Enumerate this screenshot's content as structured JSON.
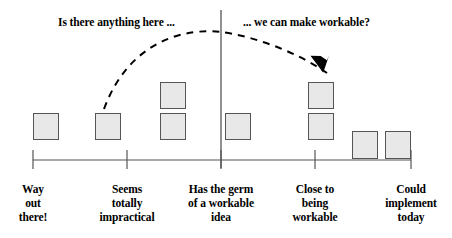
{
  "figure": {
    "colors": {
      "box_fill": "#e8e8e8",
      "box_stroke": "#555555",
      "axis_stroke": "#555555",
      "text": "#000000",
      "arc_stroke": "#000000",
      "background": "#ffffff"
    }
  },
  "annotations": {
    "left_callout": "Is there anything here ...",
    "right_callout": "... we can make workable?",
    "arrow": {
      "name": "dashed-curved-arrow",
      "start_x": 104,
      "start_y": 109,
      "peak_x": 221,
      "peak_y": 32,
      "end_x": 327,
      "end_y": 73,
      "style": "dashed",
      "arrowhead": "filled-triangle"
    }
  },
  "axis": {
    "name": "feasibility-axis",
    "line_y": 160,
    "start_x": 33,
    "end_x": 411,
    "divider_x": 221,
    "divider_top_y": 10,
    "divider_bottom_y": 168,
    "ticks": [
      {
        "x": 33,
        "lines": [
          "Way",
          "out",
          "there!"
        ]
      },
      {
        "x": 127,
        "lines": [
          "Seems",
          "totally",
          "impractical"
        ]
      },
      {
        "x": 221,
        "lines": [
          "Has the germ",
          "of a workable",
          "idea"
        ]
      },
      {
        "x": 315,
        "lines": [
          "Close to",
          "being",
          "workable"
        ]
      },
      {
        "x": 411,
        "lines": [
          "Could",
          "implement",
          "today"
        ]
      }
    ]
  },
  "chart_data": {
    "type": "bar",
    "xlabel": "",
    "ylabel": "",
    "grid": false,
    "legend": false,
    "categories": [
      "Way out there!",
      "Seems totally impractical",
      "Has the germ of a workable idea",
      "Close to being workable",
      "Could implement today"
    ],
    "stacks": [
      {
        "category": "Way out there!",
        "count": 1,
        "boxes": [
          {
            "x": 33,
            "y": 113,
            "w": 26,
            "h": 27
          }
        ]
      },
      {
        "category": "Seems totally impractical",
        "count": 1,
        "boxes": [
          {
            "x": 95,
            "y": 113,
            "w": 26,
            "h": 27
          }
        ]
      },
      {
        "category": "Has the germ of a workable idea",
        "count": 3,
        "boxes": [
          {
            "x": 160,
            "y": 82,
            "w": 26,
            "h": 27
          },
          {
            "x": 160,
            "y": 113,
            "w": 26,
            "h": 27
          },
          {
            "x": 225,
            "y": 113,
            "w": 26,
            "h": 27
          }
        ]
      },
      {
        "category": "Close to being workable",
        "count": 2,
        "boxes": [
          {
            "x": 308,
            "y": 82,
            "w": 26,
            "h": 27
          },
          {
            "x": 308,
            "y": 113,
            "w": 26,
            "h": 27
          }
        ]
      },
      {
        "category": "Could implement today",
        "count": 2,
        "boxes": [
          {
            "x": 352,
            "y": 131,
            "w": 26,
            "h": 28
          },
          {
            "x": 385,
            "y": 131,
            "w": 26,
            "h": 28
          }
        ]
      }
    ],
    "values": [
      1,
      1,
      3,
      2,
      2
    ]
  }
}
